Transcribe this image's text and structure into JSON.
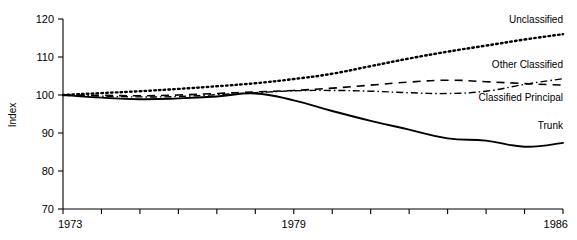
{
  "chart_data": {
    "type": "line",
    "title": "",
    "xlabel": "",
    "ylabel": "Index",
    "xlim": [
      1973,
      1986
    ],
    "ylim": [
      70,
      120
    ],
    "grid": false,
    "legend_position": "right-inline",
    "x": [
      1973,
      1974,
      1975,
      1976,
      1977,
      1978,
      1979,
      1980,
      1981,
      1982,
      1983,
      1984,
      1985,
      1986
    ],
    "x_tick_labels": [
      "1973",
      "",
      "",
      "",
      "",
      "",
      "1979",
      "",
      "",
      "",
      "",
      "",
      "",
      "1986"
    ],
    "x_ticks_major": [
      "1973",
      "1979",
      "1986"
    ],
    "y_tick_labels": [
      "70",
      "80",
      "90",
      "100",
      "110",
      "120"
    ],
    "y_ticks": [
      70,
      80,
      90,
      100,
      110,
      120
    ],
    "series": [
      {
        "name": "Unclassified",
        "style": "dotted",
        "label": "Unclassified",
        "values": [
          100.0,
          100.5,
          101.0,
          101.6,
          102.3,
          103.1,
          104.2,
          105.6,
          107.6,
          109.6,
          111.4,
          113.0,
          114.6,
          116.0
        ]
      },
      {
        "name": "Other Classified",
        "style": "dashed",
        "label": "Other Classified",
        "values": [
          100.0,
          99.9,
          99.8,
          100.0,
          100.4,
          100.8,
          101.2,
          101.8,
          102.6,
          103.4,
          103.9,
          103.5,
          103.0,
          102.6
        ]
      },
      {
        "name": "Classified Principal",
        "style": "dash-dot",
        "label": "Classified Principal",
        "values": [
          100.0,
          99.7,
          99.5,
          99.6,
          100.1,
          100.6,
          101.1,
          101.2,
          101.0,
          100.6,
          100.4,
          101.0,
          102.8,
          104.3
        ]
      },
      {
        "name": "Trunk",
        "style": "solid",
        "label": "Trunk",
        "values": [
          100.0,
          99.3,
          98.9,
          99.1,
          99.6,
          100.4,
          98.6,
          95.8,
          93.2,
          90.9,
          88.6,
          88.0,
          86.4,
          87.4
        ]
      }
    ],
    "series_label_anchors": [
      {
        "name": "Unclassified",
        "x": 1986,
        "y": 119.0
      },
      {
        "name": "Other Classified",
        "x": 1986,
        "y": 107.0
      },
      {
        "name": "Classified Principal",
        "x": 1986,
        "y": 98.5
      },
      {
        "name": "Trunk",
        "x": 1986,
        "y": 91.0
      }
    ]
  },
  "axes": {
    "y_axis_title": "Index"
  }
}
